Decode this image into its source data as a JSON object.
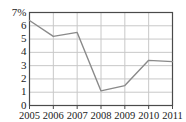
{
  "chart_data": {
    "type": "line",
    "title": "",
    "xlabel": "",
    "ylabel": "",
    "categories": [
      "2005",
      "2006",
      "2007",
      "2008",
      "2009",
      "2010",
      "2011"
    ],
    "values": [
      6.4,
      5.2,
      5.5,
      1.1,
      1.5,
      3.4,
      3.3
    ],
    "series": [
      {
        "name": "",
        "values": [
          6.4,
          5.2,
          5.5,
          1.1,
          1.5,
          3.4,
          3.3
        ]
      }
    ],
    "ylim": [
      0,
      7
    ],
    "xlim": [
      "2005",
      "2011"
    ],
    "ytick_labels": [
      "7%",
      "6",
      "5",
      "4",
      "3",
      "2",
      "1",
      "0"
    ],
    "ytick_values": [
      7,
      6,
      5,
      4,
      3,
      2,
      1,
      0
    ],
    "xtick_labels": [
      "2005",
      "2006",
      "2007",
      "2008",
      "2009",
      "2010",
      "2011"
    ],
    "grid": true,
    "grid_axis": "both",
    "legend": false,
    "legend_position": "none",
    "markers": false,
    "colors": {
      "line": "#8a8a8a",
      "grid": "#c8c8c8",
      "axis": "#4a4a4a",
      "text": "#1a1a1a",
      "background": "#ffffff"
    }
  }
}
